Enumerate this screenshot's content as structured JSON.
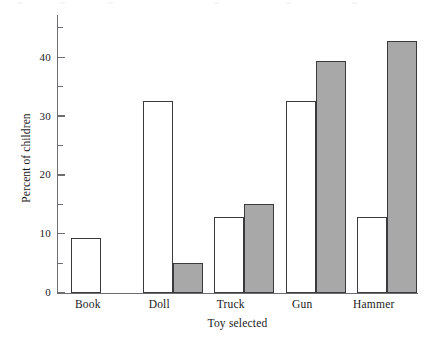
{
  "chart_data": {
    "type": "bar",
    "title": "",
    "subtitle": "",
    "xlabel": "Toy selected",
    "ylabel": "Percent of children",
    "categories": [
      "Book",
      "Doll",
      "Truck",
      "Gun",
      "Hammer"
    ],
    "series": [
      {
        "name": "light",
        "color": "#ffffff",
        "values": [
          9.3,
          32.5,
          12.8,
          32.5,
          12.8
        ]
      },
      {
        "name": "dark",
        "color": "#a8a8a8",
        "values": [
          0,
          5.0,
          15.1,
          39.4,
          42.7
        ]
      }
    ],
    "ylim": [
      0,
      47
    ],
    "ymajor_ticks": [
      0,
      10,
      20,
      30,
      40
    ],
    "yminor_ticks": [
      5,
      15,
      25,
      35,
      45
    ],
    "ytick_labels": [
      "0",
      "10",
      "20",
      "30",
      "40"
    ],
    "grid": false,
    "legend": "none",
    "annotations": []
  },
  "axes": {
    "y_title": "Percent of children",
    "x_title": "Toy selected"
  }
}
